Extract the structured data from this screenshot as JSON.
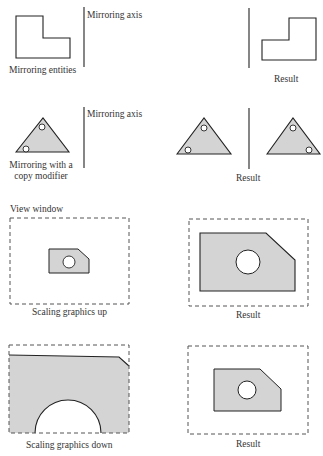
{
  "colors": {
    "fill": "#d4d4d4",
    "stroke": "#222222",
    "dash": "#555555",
    "background": "#ffffff"
  },
  "rows": [
    {
      "name": "mirroring",
      "left_caption": "Mirroring entities",
      "axis_label": "Mirroring axis",
      "right_caption": "Result"
    },
    {
      "name": "mirroring-copy",
      "left_caption_line1": "Mirroring with a",
      "left_caption_line2": "copy modifier",
      "axis_label": "Mirroring axis",
      "right_caption": "Result"
    },
    {
      "name": "scaling-up",
      "window_label": "View window",
      "left_caption": "Scaling graphics up",
      "right_caption": "Result"
    },
    {
      "name": "scaling-down",
      "left_caption": "Scaling graphics down",
      "right_caption": "Result"
    }
  ]
}
